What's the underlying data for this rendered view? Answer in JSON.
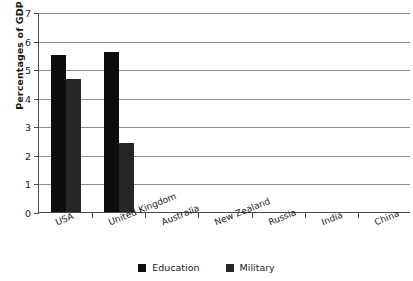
{
  "chart_data": {
    "type": "bar",
    "title": "",
    "xlabel": "",
    "ylabel": "Percentages of GDP",
    "ylim": [
      0,
      7
    ],
    "ytick_values": [
      0,
      1,
      2,
      3,
      4,
      5,
      6,
      7
    ],
    "ytick_labels": [
      "0",
      "1",
      "2",
      "3",
      "4",
      "5",
      "6",
      "7"
    ],
    "grid": true,
    "legend_position": "bottom-center",
    "categories": [
      "USA",
      "United Kingdom",
      "Australia",
      "New Zealand",
      "Russia",
      "India",
      "China"
    ],
    "series": [
      {
        "name": "Education",
        "color": "#0d0d0d",
        "values": [
          5.5,
          5.6,
          0,
          0,
          0,
          0,
          0
        ]
      },
      {
        "name": "Military",
        "color": "#262626",
        "values": [
          4.65,
          2.4,
          0,
          0,
          0,
          0,
          0
        ]
      }
    ]
  },
  "legend": {
    "entries": [
      {
        "label": "Education",
        "swatch": "education-swatch"
      },
      {
        "label": "Military",
        "swatch": "military-swatch"
      }
    ]
  }
}
